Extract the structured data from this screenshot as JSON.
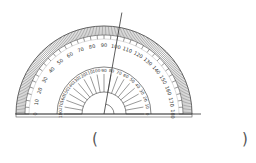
{
  "figure": {
    "type": "protractor-angle-measurement",
    "center": [
      104,
      114
    ],
    "outer_radius": 88,
    "inner_radius": 47,
    "hub_radius": 22,
    "outer_scale_labels": [
      "0",
      "10",
      "20",
      "30",
      "40",
      "50",
      "60",
      "70",
      "80",
      "90",
      "100",
      "110",
      "120",
      "130",
      "140",
      "150",
      "160",
      "170",
      "180"
    ],
    "inner_scale_labels": [
      "180",
      "170",
      "160",
      "150",
      "140",
      "130",
      "120",
      "110",
      "100",
      "90",
      "80",
      "70",
      "60",
      "50",
      "40",
      "30",
      "20",
      "10",
      "0"
    ],
    "ray_angle_deg": 80,
    "baseline_label": "0",
    "colors": {
      "stroke": "#333333",
      "hatch": "#777777",
      "bg": "#ffffff"
    }
  },
  "answer": {
    "open_paren": "(",
    "close_paren": ")",
    "value": ""
  }
}
